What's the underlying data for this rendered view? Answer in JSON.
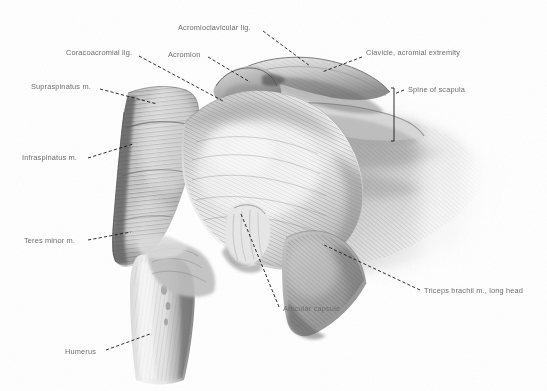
{
  "figure": {
    "width": 547,
    "height": 391,
    "background_color": "#ffffff",
    "label_color": "#6e6e6e",
    "leader_color": "#1a1a1a",
    "style": "grayscale pencil / airbrush anatomical illustration"
  },
  "labels": [
    {
      "id": "acromioclavicular-lig",
      "text": "Acromioclavicular lig.",
      "x": 178,
      "y": 23,
      "align": "left",
      "leader": [
        [
          263,
          31
        ],
        [
          310,
          66
        ]
      ]
    },
    {
      "id": "clavicle-acromial-extremity",
      "text": "Clavicle, acromial extremity",
      "x": 366,
      "y": 48,
      "align": "left",
      "leader": [
        [
          362,
          57
        ],
        [
          322,
          72
        ]
      ]
    },
    {
      "id": "acromion",
      "text": "Acromion",
      "x": 168,
      "y": 50,
      "align": "left",
      "leader": [
        [
          208,
          57
        ],
        [
          250,
          82
        ]
      ]
    },
    {
      "id": "coracoacromial-lig",
      "text": "Coracoacromial lig.",
      "x": 66,
      "y": 48,
      "align": "left",
      "leader": [
        [
          139,
          56
        ],
        [
          223,
          101
        ]
      ]
    },
    {
      "id": "spine-of-scapula",
      "text": "Spine of scapula",
      "x": 408,
      "y": 85,
      "align": "left",
      "leader": [
        [
          404,
          90
        ],
        [
          394,
          94
        ]
      ],
      "bracket": {
        "x": 394,
        "y1": 88,
        "y2": 141
      }
    },
    {
      "id": "supraspinatus-m",
      "text": "Supraspinatus m.",
      "x": 31,
      "y": 82,
      "align": "left",
      "leader": [
        [
          100,
          89
        ],
        [
          157,
          104
        ]
      ]
    },
    {
      "id": "infraspinatus-m",
      "text": "Infraspinatus m.",
      "x": 22,
      "y": 153,
      "align": "left",
      "leader": [
        [
          88,
          158
        ],
        [
          133,
          144
        ]
      ]
    },
    {
      "id": "teres-minor-m",
      "text": "Teres minor m.",
      "x": 24,
      "y": 236,
      "align": "left",
      "leader": [
        [
          88,
          240
        ],
        [
          131,
          232
        ]
      ]
    },
    {
      "id": "humerus",
      "text": "Humerus",
      "x": 65,
      "y": 347,
      "align": "left",
      "leader": [
        [
          106,
          350
        ],
        [
          150,
          334
        ]
      ]
    },
    {
      "id": "articular-capsule",
      "text": "Articular capsule",
      "x": 283,
      "y": 304,
      "align": "left",
      "leader": [
        [
          279,
          307
        ],
        [
          241,
          214
        ]
      ]
    },
    {
      "id": "triceps-brachii-long-head",
      "text": "Triceps brachii m., long head",
      "x": 424,
      "y": 286,
      "align": "left",
      "leader": [
        [
          420,
          290
        ],
        [
          322,
          244
        ]
      ]
    }
  ],
  "structures": [
    {
      "name": "clavicle",
      "kind": "bone"
    },
    {
      "name": "acromion",
      "kind": "bone"
    },
    {
      "name": "spine-of-scapula",
      "kind": "bone"
    },
    {
      "name": "humerus",
      "kind": "bone"
    },
    {
      "name": "supraspinatus-muscle",
      "kind": "muscle"
    },
    {
      "name": "infraspinatus-muscle",
      "kind": "muscle"
    },
    {
      "name": "teres-minor-muscle",
      "kind": "muscle"
    },
    {
      "name": "deltoid-mass",
      "kind": "muscle"
    },
    {
      "name": "triceps-brachii-long-head",
      "kind": "muscle"
    },
    {
      "name": "articular-capsule",
      "kind": "capsule"
    },
    {
      "name": "coracoacromial-ligament",
      "kind": "ligament"
    },
    {
      "name": "acromioclavicular-ligament",
      "kind": "ligament"
    }
  ]
}
